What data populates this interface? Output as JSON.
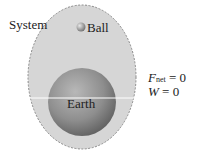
{
  "labels": {
    "system": "System",
    "ball": "Ball",
    "earth": "Earth"
  },
  "equations": {
    "fnet_symbol": "F",
    "fnet_subscript": "net",
    "fnet_value": " = 0",
    "w_symbol": "W",
    "w_value": " = 0"
  },
  "colors": {
    "system_fill": "#d6d6d6",
    "system_border": "#8a8a8a",
    "earth_light": "#a8a8a8",
    "earth_dark": "#6a6a6a"
  }
}
